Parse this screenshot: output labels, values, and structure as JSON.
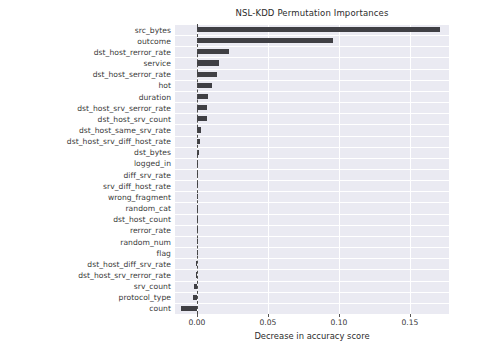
{
  "chart_data": {
    "type": "bar",
    "orientation": "horizontal",
    "title": "NSL-KDD Permutation Importances",
    "xlabel": "Decrease in accuracy score",
    "ylabel": "",
    "xlim": [
      -0.0155,
      0.1775
    ],
    "xticks": [
      0.0,
      0.05,
      0.1,
      0.15
    ],
    "xticklabels": [
      "0.00",
      "0.05",
      "0.10",
      "0.15"
    ],
    "grid": true,
    "legend": null,
    "zero_reference_line": 0.0,
    "bar_color": "#3f3f44",
    "plot_background": "#eaeaf2",
    "categories": [
      "src_bytes",
      "outcome",
      "dst_host_rerror_rate",
      "service",
      "dst_host_serror_rate",
      "hot",
      "duration",
      "dst_host_srv_serror_rate",
      "dst_host_srv_count",
      "dst_host_same_srv_rate",
      "dst_host_srv_diff_host_rate",
      "dst_bytes",
      "logged_in",
      "diff_srv_rate",
      "srv_diff_host_rate",
      "wrong_fragment",
      "random_cat",
      "dst_host_count",
      "rerror_rate",
      "random_num",
      "flag",
      "dst_host_diff_srv_rate",
      "dst_host_srv_rerror_rate",
      "srv_count",
      "protocol_type",
      "count"
    ],
    "values": [
      0.1715,
      0.0955,
      0.0222,
      0.0155,
      0.0142,
      0.0105,
      0.0078,
      0.0072,
      0.0068,
      0.0028,
      0.0019,
      0.0016,
      0.001,
      0.0008,
      0.0007,
      0.0006,
      0.0005,
      0.0004,
      0.0004,
      0.0003,
      0.0002,
      -0.0006,
      -0.0008,
      -0.0022,
      -0.0026,
      -0.0112
    ]
  }
}
